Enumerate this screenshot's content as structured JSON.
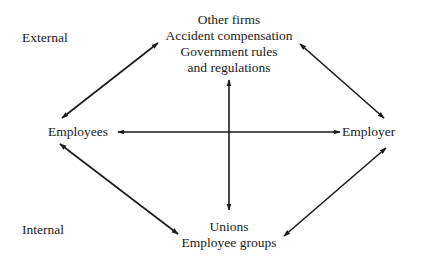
{
  "diagram": {
    "zones": {
      "external": "External",
      "internal": "Internal"
    },
    "nodes": {
      "top": {
        "lines": [
          "Other firms",
          "Accident compensation",
          "Government rules",
          "and regulations"
        ]
      },
      "left": {
        "label": "Employees"
      },
      "right": {
        "label": "Employer"
      },
      "bottom": {
        "lines": [
          "Unions",
          "Employee groups"
        ]
      }
    },
    "edges": [
      {
        "from": "left",
        "to": "top",
        "type": "double-arrow"
      },
      {
        "from": "top",
        "to": "right",
        "type": "double-arrow"
      },
      {
        "from": "left",
        "to": "right",
        "type": "double-arrow"
      },
      {
        "from": "top",
        "to": "bottom",
        "type": "double-arrow"
      },
      {
        "from": "left",
        "to": "bottom",
        "type": "double-arrow"
      },
      {
        "from": "bottom",
        "to": "right",
        "type": "double-arrow"
      }
    ],
    "colors": {
      "line": "#1a1a1a",
      "text": "#1a1a1a",
      "background": "#ffffff"
    }
  }
}
